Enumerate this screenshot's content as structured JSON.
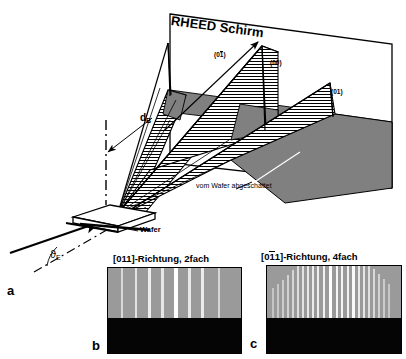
{
  "figure": {
    "caption_letters": {
      "a": "a",
      "b": "b",
      "c": "c"
    },
    "schematic": {
      "screen_label": "RHEED Schirm",
      "beam_distance_label": "d",
      "beam_distance_sub": "B",
      "incidence_angle_symbol": "ϑ",
      "incidence_angle_sub": "E",
      "sample_label": "Wafer",
      "shadow_label": "vom Wafer abgeschattet",
      "spot_labels": [
        {
          "id": "spot-0-1bar",
          "prefix": "(0",
          "bar_digit": "1",
          "suffix": ")"
        },
        {
          "id": "spot-00",
          "text": "(00)"
        },
        {
          "id": "spot-01",
          "text": "(01)"
        }
      ],
      "colors": {
        "screen_fill": "#ffffff",
        "shadow_fill": "#808080",
        "cone_hatch": "#000000",
        "outline": "#000000"
      }
    },
    "patterns": [
      {
        "id": "pattern-b",
        "letter": "b",
        "title_prefix": "[011]-Richtung, ",
        "title_full": "[011]-Richtung, 2fach",
        "direction": "[011]",
        "symmetry": "2fach",
        "bar_over_index": null,
        "background_gray": "#9a9a9a",
        "shadow_black": "#050505",
        "streak_color": "#f2f2f2",
        "streak_count": 8,
        "streaks": [
          {
            "x": 13,
            "w": 2.0,
            "h": 50,
            "i": 0.72
          },
          {
            "x": 27,
            "w": 2.4,
            "h": 62,
            "i": 0.8
          },
          {
            "x": 40,
            "w": 3.0,
            "h": 68,
            "i": 0.88
          },
          {
            "x": 53,
            "w": 2.6,
            "h": 63,
            "i": 0.82
          },
          {
            "x": 66,
            "w": 4.0,
            "h": 72,
            "i": 1.0
          },
          {
            "x": 80,
            "w": 2.6,
            "h": 64,
            "i": 0.84
          },
          {
            "x": 93,
            "w": 3.0,
            "h": 66,
            "i": 0.86
          },
          {
            "x": 110,
            "w": 2.2,
            "h": 54,
            "i": 0.7
          }
        ]
      },
      {
        "id": "pattern-c",
        "letter": "c",
        "title_prefix": "[01",
        "title_full": "[011]-Richtung, 4fach",
        "direction": "[011]",
        "symmetry": "4fach",
        "bar_over_index": 2,
        "background_gray": "#9a9a9a",
        "shadow_black": "#050505",
        "streak_color": "#f2f2f2",
        "streak_count": 23,
        "streaks": [
          {
            "x": 5,
            "w": 1.6,
            "h": 30,
            "i": 0.55
          },
          {
            "x": 10,
            "w": 1.6,
            "h": 34,
            "i": 0.58
          },
          {
            "x": 15,
            "w": 1.6,
            "h": 38,
            "i": 0.62
          },
          {
            "x": 20,
            "w": 1.8,
            "h": 43,
            "i": 0.66
          },
          {
            "x": 25,
            "w": 1.8,
            "h": 48,
            "i": 0.7
          },
          {
            "x": 30,
            "w": 2.0,
            "h": 53,
            "i": 0.76
          },
          {
            "x": 35,
            "w": 2.0,
            "h": 57,
            "i": 0.8
          },
          {
            "x": 40,
            "w": 2.2,
            "h": 60,
            "i": 0.84
          },
          {
            "x": 45,
            "w": 2.0,
            "h": 62,
            "i": 0.86
          },
          {
            "x": 50,
            "w": 2.2,
            "h": 64,
            "i": 0.88
          },
          {
            "x": 56,
            "w": 2.0,
            "h": 65,
            "i": 0.9
          },
          {
            "x": 62,
            "w": 3.2,
            "h": 70,
            "i": 1.0
          },
          {
            "x": 69,
            "w": 2.0,
            "h": 66,
            "i": 0.92
          },
          {
            "x": 74,
            "w": 2.2,
            "h": 67,
            "i": 0.93
          },
          {
            "x": 80,
            "w": 2.0,
            "h": 65,
            "i": 0.9
          },
          {
            "x": 85,
            "w": 2.8,
            "h": 68,
            "i": 0.96
          },
          {
            "x": 91,
            "w": 2.0,
            "h": 62,
            "i": 0.86
          },
          {
            "x": 96,
            "w": 2.0,
            "h": 58,
            "i": 0.82
          },
          {
            "x": 101,
            "w": 1.8,
            "h": 54,
            "i": 0.78
          },
          {
            "x": 106,
            "w": 1.8,
            "h": 49,
            "i": 0.72
          },
          {
            "x": 111,
            "w": 1.6,
            "h": 44,
            "i": 0.66
          },
          {
            "x": 116,
            "w": 1.6,
            "h": 39,
            "i": 0.6
          },
          {
            "x": 121,
            "w": 1.6,
            "h": 34,
            "i": 0.56
          }
        ]
      }
    ]
  }
}
